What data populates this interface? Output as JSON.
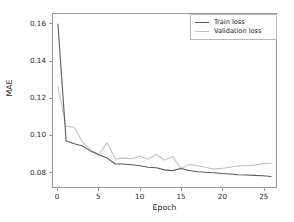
{
  "chart_data": {
    "type": "line",
    "title": "",
    "xlabel": "Epoch",
    "ylabel": "MAE",
    "xlim": [
      -0.6,
      26.6
    ],
    "ylim": [
      0.0715,
      0.1655
    ],
    "xticks": [
      0,
      5,
      10,
      15,
      20,
      25
    ],
    "yticks": [
      0.08,
      0.1,
      0.12,
      0.14,
      0.16
    ],
    "ytick_labels": [
      "0.08",
      "0.10",
      "0.12",
      "0.14",
      "0.16"
    ],
    "xtick_labels": [
      "0",
      "5",
      "10",
      "15",
      "20",
      "25"
    ],
    "grid": false,
    "legend_position": "upper right",
    "x": [
      0,
      1,
      2,
      3,
      4,
      5,
      6,
      7,
      8,
      9,
      10,
      11,
      12,
      13,
      14,
      15,
      16,
      17,
      18,
      19,
      20,
      21,
      22,
      23,
      24,
      25,
      26
    ],
    "series": [
      {
        "name": "Train loss",
        "color": "#5a5a5a",
        "values": [
          0.16,
          0.0965,
          0.095,
          0.0938,
          0.091,
          0.089,
          0.0872,
          0.084,
          0.084,
          0.0836,
          0.083,
          0.0822,
          0.082,
          0.0808,
          0.0804,
          0.0816,
          0.0805,
          0.0798,
          0.0795,
          0.0792,
          0.0788,
          0.0786,
          0.0782,
          0.078,
          0.0778,
          0.0776,
          0.0772
        ]
      },
      {
        "name": "Validation loss",
        "color": "#c2c2c2",
        "values": [
          0.1262,
          0.1045,
          0.104,
          0.096,
          0.0915,
          0.089,
          0.0956,
          0.0868,
          0.0872,
          0.0868,
          0.0882,
          0.0866,
          0.0892,
          0.0862,
          0.088,
          0.0815,
          0.0838,
          0.083,
          0.0822,
          0.0812,
          0.0816,
          0.0822,
          0.083,
          0.0832,
          0.0834,
          0.0842,
          0.0844
        ]
      }
    ]
  },
  "legend": {
    "entries": [
      {
        "label": "Train loss"
      },
      {
        "label": "Validation loss"
      }
    ]
  },
  "axes": {
    "x_title": "Epoch",
    "y_title": "MAE"
  },
  "colors": {
    "train": "#5a5a5a",
    "validation": "#c2c2c2",
    "axis": "#9a9a9a",
    "background": "#ffffff"
  }
}
